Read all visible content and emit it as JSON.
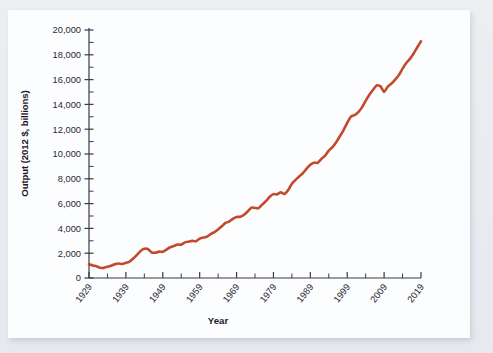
{
  "chart_data": {
    "type": "line",
    "title": "",
    "xlabel": "Year",
    "ylabel": "Output (2012 $, billions)",
    "xlim": [
      1929,
      2019
    ],
    "ylim": [
      0,
      20000
    ],
    "grid": false,
    "legend": null,
    "line_color": "#C2492B",
    "y_ticks_major": [
      0,
      2000,
      4000,
      6000,
      8000,
      10000,
      12000,
      14000,
      16000,
      18000,
      20000
    ],
    "y_tick_labels": [
      "0",
      "2,000",
      "4,000",
      "6,000",
      "8,000",
      "10,000",
      "12,000",
      "14,000",
      "16,000",
      "18,000",
      "20,000"
    ],
    "y_minor_tick_interval": 1000,
    "x_ticks_labeled": [
      1929,
      1939,
      1949,
      1959,
      1969,
      1979,
      1989,
      1999,
      2009,
      2019
    ],
    "x_tick_labels": [
      "1929",
      "1939",
      "1949",
      "1959",
      "1969",
      "1979",
      "1989",
      "1999",
      "2009",
      "2019"
    ],
    "x_minor_tick_interval": 5,
    "series": [
      {
        "name": "Real GDP",
        "x": [
          1929,
          1930,
          1931,
          1932,
          1933,
          1934,
          1935,
          1936,
          1937,
          1938,
          1939,
          1940,
          1941,
          1942,
          1943,
          1944,
          1945,
          1946,
          1947,
          1948,
          1949,
          1950,
          1951,
          1952,
          1953,
          1954,
          1955,
          1956,
          1957,
          1958,
          1959,
          1960,
          1961,
          1962,
          1963,
          1964,
          1965,
          1966,
          1967,
          1968,
          1969,
          1970,
          1971,
          1972,
          1973,
          1974,
          1975,
          1976,
          1977,
          1978,
          1979,
          1980,
          1981,
          1982,
          1983,
          1984,
          1985,
          1986,
          1987,
          1988,
          1989,
          1990,
          1991,
          1992,
          1993,
          1994,
          1995,
          1996,
          1997,
          1998,
          1999,
          2000,
          2001,
          2002,
          2003,
          2004,
          2005,
          2006,
          2007,
          2008,
          2009,
          2010,
          2011,
          2012,
          2013,
          2014,
          2015,
          2016,
          2017,
          2018,
          2019
        ],
        "values": [
          1110,
          1015,
          950,
          827,
          816,
          905,
          986,
          1113,
          1170,
          1131,
          1222,
          1330,
          1566,
          1862,
          2178,
          2350,
          2325,
          2060,
          2040,
          2125,
          2113,
          2297,
          2481,
          2578,
          2698,
          2681,
          2871,
          2931,
          2990,
          2967,
          3176,
          3257,
          3341,
          3544,
          3700,
          3915,
          4167,
          4442,
          4556,
          4777,
          4927,
          4935,
          5098,
          5367,
          5676,
          5645,
          5634,
          5938,
          6212,
          6558,
          6764,
          6745,
          6917,
          6779,
          7090,
          7601,
          7916,
          8190,
          8462,
          8816,
          9132,
          9302,
          9285,
          9608,
          9874,
          10276,
          10545,
          10941,
          11430,
          11935,
          12518,
          13015,
          13140,
          13376,
          13758,
          14290,
          14771,
          15183,
          15530,
          15460,
          15009,
          15440,
          15680,
          16000,
          16360,
          16880,
          17340,
          17670,
          18100,
          18610,
          19090
        ]
      }
    ]
  },
  "axes": {
    "y_title": "Output (2012 $, billions)",
    "x_title": "Year"
  }
}
